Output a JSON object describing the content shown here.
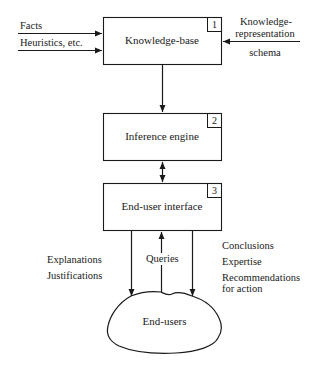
{
  "diagram": {
    "boxes": [
      {
        "id": 1,
        "number": "1",
        "label": "Knowledge-base"
      },
      {
        "id": 2,
        "number": "2",
        "label": "Inference engine"
      },
      {
        "id": 3,
        "number": "3",
        "label": "End-user interface"
      }
    ],
    "cloud": {
      "label": "End-users"
    },
    "inputs_left": [
      "Facts",
      "Heuristics, etc."
    ],
    "input_right": {
      "line1": "Knowledge-",
      "line2": "representation",
      "line3": "schema"
    },
    "left_outputs": [
      "Explanations",
      "Justifications"
    ],
    "middle_input": "Queries",
    "right_outputs": [
      "Conclusions",
      "Expertise",
      "Recommendations",
      "for action"
    ],
    "colors": {
      "stroke": "#1a1a1a",
      "background": "#ffffff"
    }
  }
}
